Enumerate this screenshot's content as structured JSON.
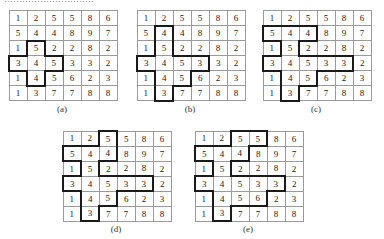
{
  "top_clipped_text": "…………………………",
  "grid_values": [
    [
      "1",
      "2",
      "5",
      "5",
      "8",
      "6"
    ],
    [
      "5",
      "4",
      "4",
      "8",
      "9",
      "7"
    ],
    [
      "1",
      "5",
      "2",
      "2",
      "8",
      "2"
    ],
    [
      "3",
      "4",
      "5",
      "3",
      "3",
      "2"
    ],
    [
      "1",
      "4",
      "5",
      "6",
      "2",
      "3"
    ],
    [
      "1",
      "3",
      "7",
      "7",
      "8",
      "8"
    ]
  ],
  "panels": [
    {
      "id": "a",
      "label": "(a)",
      "left": 8,
      "top": 10,
      "region": [
        [
          2,
          1
        ],
        [
          3,
          0
        ],
        [
          3,
          1
        ],
        [
          3,
          2
        ],
        [
          4,
          1
        ]
      ]
    },
    {
      "id": "b",
      "label": "(b)",
      "left": 136,
      "top": 10,
      "region": [
        [
          1,
          1
        ],
        [
          2,
          1
        ],
        [
          3,
          0
        ],
        [
          3,
          1
        ],
        [
          3,
          2
        ],
        [
          3,
          3
        ],
        [
          4,
          1
        ],
        [
          4,
          2
        ],
        [
          5,
          1
        ]
      ]
    },
    {
      "id": "c",
      "label": "(c)",
      "left": 262,
      "top": 10,
      "region": [
        [
          1,
          0
        ],
        [
          1,
          1
        ],
        [
          1,
          2
        ],
        [
          2,
          1
        ],
        [
          3,
          0
        ],
        [
          3,
          1
        ],
        [
          3,
          2
        ],
        [
          3,
          3
        ],
        [
          3,
          4
        ],
        [
          4,
          1
        ],
        [
          4,
          2
        ],
        [
          5,
          1
        ]
      ]
    },
    {
      "id": "d",
      "label": "(d)",
      "left": 62,
      "top": 130,
      "region": [
        [
          0,
          2
        ],
        [
          1,
          0
        ],
        [
          1,
          1
        ],
        [
          1,
          2
        ],
        [
          2,
          1
        ],
        [
          3,
          0
        ],
        [
          3,
          1
        ],
        [
          3,
          2
        ],
        [
          3,
          3
        ],
        [
          3,
          4
        ],
        [
          4,
          1
        ],
        [
          4,
          2
        ],
        [
          5,
          1
        ]
      ]
    },
    {
      "id": "e",
      "label": "(e)",
      "left": 194,
      "top": 130,
      "region": [
        [
          0,
          2
        ],
        [
          0,
          3
        ],
        [
          1,
          0
        ],
        [
          1,
          1
        ],
        [
          1,
          2
        ],
        [
          2,
          1
        ],
        [
          3,
          0
        ],
        [
          3,
          1
        ],
        [
          3,
          2
        ],
        [
          3,
          3
        ],
        [
          3,
          4
        ],
        [
          4,
          1
        ],
        [
          4,
          2
        ],
        [
          4,
          3
        ],
        [
          5,
          1
        ]
      ]
    }
  ],
  "colors": {
    "thick_border": "#1a1a1a",
    "thin_border": "#9a9a9a",
    "text": "#222222"
  }
}
